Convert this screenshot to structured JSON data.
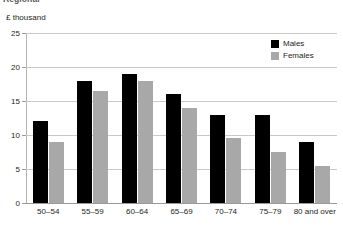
{
  "figure": {
    "heading": "Regional",
    "y_unit_label": "£ thousand"
  },
  "legend": {
    "position": "top-right",
    "items": [
      {
        "label": "Males",
        "color": "#000000",
        "swatch_name": "legend-swatch-males"
      },
      {
        "label": "Females",
        "color": "#a8a8a8",
        "swatch_name": "legend-swatch-females"
      }
    ]
  },
  "chart_data": {
    "type": "bar",
    "title": "Regional",
    "subtitle": "",
    "xlabel": "",
    "ylabel": "£ thousand",
    "ylim": [
      0,
      25
    ],
    "yticks": [
      0,
      5,
      10,
      15,
      20,
      25
    ],
    "ytick_labels": [
      "0",
      "5",
      "10",
      "15",
      "20",
      "25"
    ],
    "grid": true,
    "legend_position": "top-right",
    "categories": [
      "50–54",
      "55–59",
      "60–64",
      "65–69",
      "70–74",
      "75–79",
      "80 and over"
    ],
    "series": [
      {
        "name": "Males",
        "color": "#000000",
        "values": [
          12,
          18,
          19,
          16,
          13,
          13,
          9
        ]
      },
      {
        "name": "Females",
        "color": "#a8a8a8",
        "values": [
          9,
          16.5,
          18,
          14,
          9.5,
          7.5,
          5.5
        ]
      }
    ]
  }
}
